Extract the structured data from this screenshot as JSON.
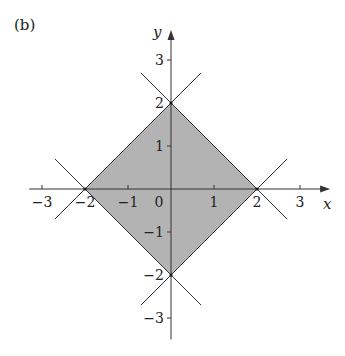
{
  "panel_label": "(b)",
  "axes": {
    "x_label": "x",
    "y_label": "y",
    "origin_px": [
      171,
      189
    ],
    "unit_px": 43,
    "x_range": [
      -3.3,
      3.7
    ],
    "y_range": [
      -3.5,
      3.7
    ],
    "x_ticks": [
      {
        "value": -3,
        "label": "−3"
      },
      {
        "value": -1,
        "label": "−1"
      },
      {
        "value": 1,
        "label": "1"
      },
      {
        "value": 3,
        "label": "3"
      }
    ],
    "x_tick_labels_at_vertices": [
      {
        "value": -2,
        "label": "−2"
      },
      {
        "value": 2,
        "label": "2"
      }
    ],
    "origin_label": "0",
    "y_ticks": [
      {
        "value": 3,
        "label": "3"
      },
      {
        "value": 1,
        "label": "1"
      },
      {
        "value": -1,
        "label": "−1"
      },
      {
        "value": -3,
        "label": "−3"
      }
    ],
    "y_tick_labels_at_vertices": [
      {
        "value": 2,
        "label": "2"
      },
      {
        "value": -2,
        "label": "−2"
      }
    ]
  },
  "region": {
    "description": "|x| + |y| <= 2",
    "vertices": [
      [
        2,
        0
      ],
      [
        0,
        2
      ],
      [
        -2,
        0
      ],
      [
        0,
        -2
      ]
    ],
    "fill": "#b3b3b3",
    "stroke": "#333333"
  },
  "lines": [
    {
      "name": "x+y=2",
      "from": [
        -0.7,
        2.7
      ],
      "to": [
        2.7,
        -0.7
      ]
    },
    {
      "name": "-x+y=2",
      "from": [
        0.7,
        2.7
      ],
      "to": [
        -2.7,
        -0.7
      ]
    },
    {
      "name": "x+y=-2",
      "from": [
        -2.7,
        0.7
      ],
      "to": [
        0.7,
        -2.7
      ]
    },
    {
      "name": "x-y=2",
      "from": [
        2.7,
        0.7
      ],
      "to": [
        -0.7,
        -2.7
      ]
    }
  ],
  "colors": {
    "axis": "#333333",
    "text": "#222222"
  }
}
